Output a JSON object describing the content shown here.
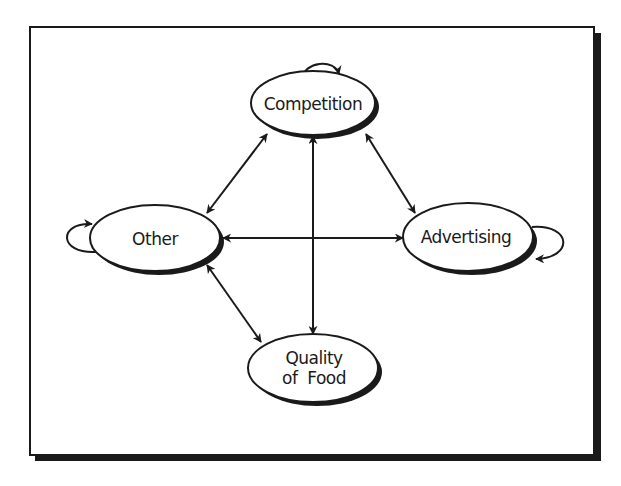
{
  "diagram": {
    "type": "relationship-diagram",
    "colors": {
      "line": "#1a1a1a",
      "background": "#ffffff",
      "frame": "#1a1a1a"
    },
    "nodes": [
      {
        "id": "competition",
        "label": "Competition",
        "lines": [
          "Competition"
        ],
        "cx": 313,
        "cy": 103,
        "rx": 62,
        "ry": 32,
        "self_loop": true
      },
      {
        "id": "other",
        "label": "Other",
        "lines": [
          "Other"
        ],
        "cx": 155,
        "cy": 238,
        "rx": 65,
        "ry": 33,
        "self_loop": true
      },
      {
        "id": "advertising",
        "label": "Advertising",
        "lines": [
          "Advertising"
        ],
        "cx": 468,
        "cy": 237,
        "rx": 65,
        "ry": 34,
        "self_loop": true
      },
      {
        "id": "quality",
        "label": "Quality of Food",
        "lines": [
          "Quality",
          "of  Food"
        ],
        "cx": 313,
        "cy": 368,
        "rx": 65,
        "ry": 34,
        "self_loop": false
      }
    ],
    "edges": [
      {
        "from": "other",
        "to": "competition",
        "direction": "both"
      },
      {
        "from": "competition",
        "to": "advertising",
        "direction": "both"
      },
      {
        "from": "other",
        "to": "advertising",
        "direction": "both"
      },
      {
        "from": "competition",
        "to": "quality",
        "direction": "both"
      },
      {
        "from": "other",
        "to": "quality",
        "direction": "both"
      }
    ]
  }
}
